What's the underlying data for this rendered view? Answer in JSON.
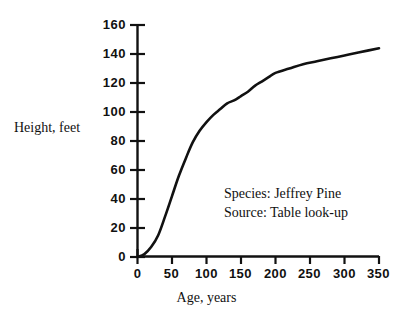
{
  "chart_data": {
    "type": "line",
    "title": "",
    "subtitle": "",
    "xlabel": "Age, years",
    "ylabel": "Height, feet",
    "xlim": [
      0,
      350
    ],
    "ylim": [
      0,
      160
    ],
    "grid": false,
    "legend": null,
    "x_ticks": [
      "0",
      "50",
      "100",
      "150",
      "200",
      "250",
      "300",
      "350"
    ],
    "y_ticks": [
      "0",
      "20",
      "40",
      "60",
      "80",
      "100",
      "120",
      "140",
      "160"
    ],
    "x_tick_values": [
      0,
      50,
      100,
      150,
      200,
      250,
      300,
      350
    ],
    "y_tick_values": [
      0,
      20,
      40,
      60,
      80,
      100,
      120,
      140,
      160
    ],
    "series": [
      {
        "name": "Jeffrey Pine height",
        "x": [
          0,
          10,
          20,
          30,
          40,
          50,
          60,
          70,
          80,
          90,
          100,
          110,
          120,
          130,
          140,
          150,
          160,
          170,
          180,
          190,
          200,
          220,
          240,
          260,
          280,
          300,
          320,
          350
        ],
        "values": [
          0,
          2,
          7,
          15,
          28,
          42,
          56,
          68,
          79,
          87,
          93,
          98,
          102,
          106,
          108,
          111,
          114,
          118,
          121,
          124,
          127,
          130,
          133,
          135,
          137,
          139,
          141,
          144
        ]
      }
    ],
    "annotations": [
      "Species: Jeffrey Pine",
      "Source: Table look-up"
    ],
    "colors": {
      "line": "#111111",
      "axis": "#111111",
      "background": "#ffffff"
    }
  },
  "annotation": {
    "species_line": "Species: Jeffrey Pine",
    "source_line": "Source: Table look-up"
  },
  "axes": {
    "x_title": "Age, years",
    "y_title": "Height, feet"
  }
}
